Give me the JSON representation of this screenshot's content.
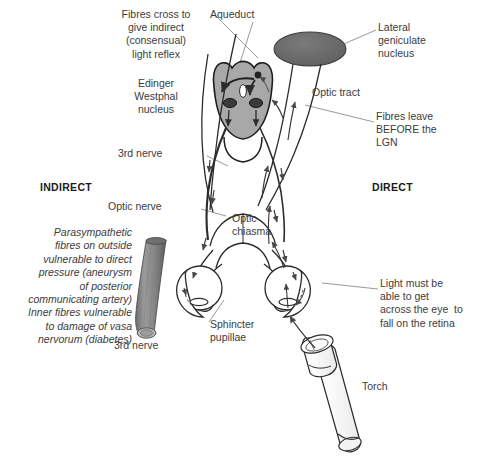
{
  "figure": {
    "colors": {
      "midbrain_fill": "#a8a8a8",
      "nucleus_dark": "#3a3a3a",
      "lgn_fill": "#686868",
      "nerve_cylinder": "#8a8a8a",
      "line": "#2b2b2b",
      "leader": "#8d8d8d",
      "text": "#3c3c3c",
      "background": "#ffffff"
    }
  },
  "labels": {
    "fibres_cross": "Fibres cross to\ngive indirect\n(consensual)\nlight reflex",
    "aqueduct": "Aqueduct",
    "lateral_geniculate_nucleus": "Lateral\ngeniculate\nnucleus",
    "edinger_westphal": "Edinger\nWestphal\nnucleus",
    "optic_tract": "Optic tract",
    "fibres_leave": "Fibres leave\nBEFORE the\nLGN",
    "third_nerve_top": "3rd nerve",
    "indirect": "INDIRECT",
    "direct": "DIRECT",
    "optic_nerve": "Optic nerve",
    "optic_chiasma": "Optic\nchiasma",
    "parasympathetic_note": "Parasympathetic\nfibres on outside\nvulnerable to direct\npressure (aneurysm\nof posterior\ncommunicating artery)\nInner fibres vulnerable\nto damage of vasa\nnervorum (diabetes)",
    "light_must": "Light must be\nable to get\nacross the eye  to\nfall on the retina",
    "sphincter_pupillae": "Sphincter\npupillae",
    "third_nerve_bottom": "3rd nerve",
    "torch": "Torch"
  },
  "structures": [
    {
      "name": "midbrain",
      "description": "shield-shaped midbrain cross-section, grey fill"
    },
    {
      "name": "cerebral-aqueduct",
      "description": "white oval in midbrain"
    },
    {
      "name": "edinger-westphal-nuclei",
      "description": "two dark oval nuclei"
    },
    {
      "name": "pretectal-nucleus",
      "description": "small dark dot upper right of midbrain"
    },
    {
      "name": "lateral-geniculate-nucleus",
      "description": "dark grey ellipse, upper right"
    },
    {
      "name": "optic-chiasma",
      "description": "X crossing of optic nerves"
    },
    {
      "name": "left-eye",
      "description": "eyeball outline, indirect side"
    },
    {
      "name": "right-eye",
      "description": "eyeball outline, direct side, illuminated"
    },
    {
      "name": "third-nerve-cylinder",
      "description": "grey cylinder lower left"
    },
    {
      "name": "torch",
      "description": "cylindrical torch shining into right eye"
    }
  ]
}
